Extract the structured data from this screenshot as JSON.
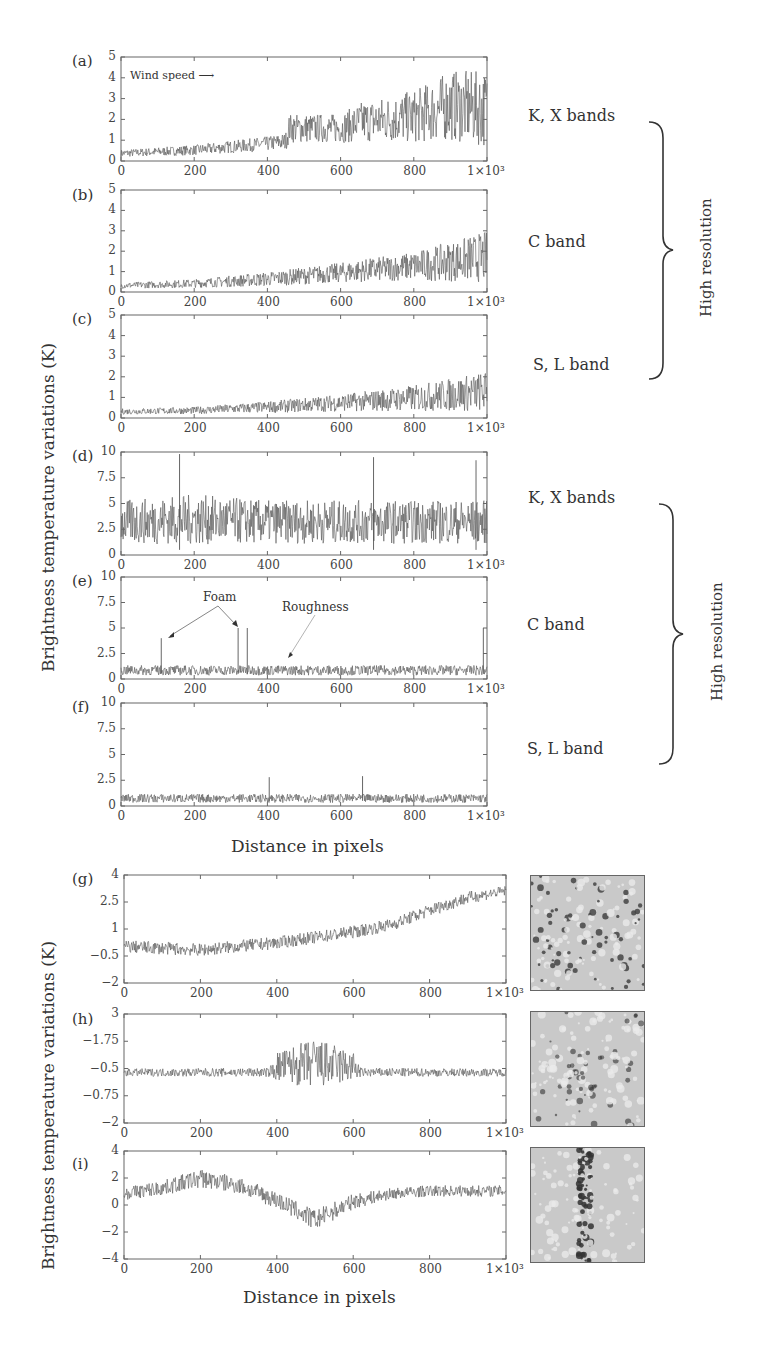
{
  "figure": {
    "y_axis_label_top": "Brightness temperature variations (K)",
    "y_axis_label_bottom": "Brightness temperature variations (K)",
    "x_axis_label_top": "Distance in pixels",
    "x_axis_label_bottom": "Distance in pixels",
    "bracket_label_1": "High resolution",
    "bracket_label_2": "High resolution",
    "bands": {
      "a": "K, X bands",
      "b": "C band",
      "c": "S, L band",
      "d": "K, X bands",
      "e": "C band",
      "f": "S, L band"
    },
    "annotations": {
      "wind_speed": "Wind speed",
      "foam": "Foam",
      "roughness": "Roughness"
    },
    "x_ticks": [
      "0",
      "200",
      "400",
      "600",
      "800",
      "1×10³"
    ],
    "line_color": "#555555"
  },
  "chart_data": [
    {
      "panel": "a",
      "label": "(a)",
      "type": "line",
      "band": "K, X bands",
      "xlabel": "Distance in pixels",
      "ylabel": "Brightness temperature variations (K)",
      "xlim": [
        0,
        1000
      ],
      "ylim": [
        0,
        5
      ],
      "yticks": [
        "0",
        "1",
        "2",
        "3",
        "4",
        "5"
      ],
      "x_ticks": [
        0,
        200,
        400,
        600,
        800,
        1000
      ],
      "annotation": "Wind speed →",
      "trend": {
        "x": [
          0,
          200,
          400,
          450,
          460,
          600,
          660,
          800,
          900,
          1000
        ],
        "mean": [
          0.35,
          0.5,
          0.8,
          0.9,
          1.5,
          1.5,
          1.8,
          2.0,
          2.5,
          2.3
        ],
        "spread": [
          0.25,
          0.35,
          0.5,
          0.6,
          1.0,
          1.0,
          1.4,
          1.8,
          2.4,
          2.6
        ]
      }
    },
    {
      "panel": "b",
      "label": "(b)",
      "type": "line",
      "band": "C band",
      "xlim": [
        0,
        1000
      ],
      "ylim": [
        0,
        5
      ],
      "yticks": [
        "0",
        "1",
        "2",
        "3",
        "4",
        "5"
      ],
      "trend": {
        "x": [
          0,
          200,
          400,
          600,
          800,
          1000
        ],
        "mean": [
          0.3,
          0.4,
          0.6,
          0.9,
          1.2,
          1.6
        ],
        "spread": [
          0.2,
          0.3,
          0.5,
          0.7,
          1.0,
          1.8
        ]
      }
    },
    {
      "panel": "c",
      "label": "(c)",
      "type": "line",
      "band": "S, L band",
      "xlim": [
        0,
        1000
      ],
      "ylim": [
        0,
        5
      ],
      "yticks": [
        "0",
        "1",
        "2",
        "3",
        "4",
        "5"
      ],
      "trend": {
        "x": [
          0,
          200,
          400,
          600,
          800,
          1000
        ],
        "mean": [
          0.3,
          0.35,
          0.5,
          0.7,
          0.9,
          1.2
        ],
        "spread": [
          0.2,
          0.25,
          0.4,
          0.6,
          0.9,
          1.4
        ]
      }
    },
    {
      "panel": "d",
      "label": "(d)",
      "type": "line",
      "band": "K, X bands",
      "xlim": [
        0,
        1000
      ],
      "ylim": [
        0,
        10
      ],
      "yticks": [
        "0",
        "2.5",
        "5",
        "7.5",
        "10"
      ],
      "trend": {
        "x": [
          0,
          200,
          400,
          600,
          800,
          1000
        ],
        "mean": [
          3,
          3.2,
          3,
          3,
          3,
          3
        ],
        "spread": [
          3,
          3.5,
          3,
          3,
          3,
          3
        ]
      },
      "peaks": [
        [
          160,
          9.8
        ],
        [
          690,
          9.5
        ],
        [
          970,
          9.2
        ]
      ]
    },
    {
      "panel": "e",
      "label": "(e)",
      "type": "line",
      "band": "C band",
      "xlim": [
        0,
        1000
      ],
      "ylim": [
        0,
        10
      ],
      "yticks": [
        "0",
        "2.5",
        "5",
        "7.5",
        "10"
      ],
      "annotations": [
        "Foam",
        "Roughness"
      ],
      "trend": {
        "x": [
          0,
          1000
        ],
        "mean": [
          0.8,
          0.8
        ],
        "spread": [
          0.7,
          0.7
        ]
      },
      "peaks": [
        [
          110,
          4.0
        ],
        [
          320,
          5.0
        ],
        [
          345,
          5.0
        ],
        [
          990,
          5.0
        ]
      ]
    },
    {
      "panel": "f",
      "label": "(f)",
      "type": "line",
      "band": "S, L band",
      "xlim": [
        0,
        1000
      ],
      "ylim": [
        0,
        10
      ],
      "yticks": [
        "0",
        "2.5",
        "5",
        "7.5",
        "10"
      ],
      "trend": {
        "x": [
          0,
          1000
        ],
        "mean": [
          0.7,
          0.7
        ],
        "spread": [
          0.6,
          0.6
        ]
      },
      "peaks": [
        [
          405,
          2.8
        ],
        [
          660,
          2.9
        ]
      ]
    },
    {
      "panel": "g",
      "label": "(g)",
      "type": "line",
      "xlim": [
        0,
        1000
      ],
      "ylim": [
        -2,
        4
      ],
      "yticks": [
        "-2",
        "-0.5",
        "1",
        "2.5",
        "4"
      ],
      "trend": {
        "x": [
          0,
          200,
          400,
          600,
          700,
          800,
          900,
          1000
        ],
        "mean": [
          0,
          -0.2,
          0.2,
          0.8,
          1.2,
          2.0,
          2.7,
          3.1
        ],
        "spread": [
          0.5,
          0.5,
          0.5,
          0.5,
          0.5,
          0.5,
          0.5,
          0.4
        ]
      }
    },
    {
      "panel": "h",
      "label": "(h)",
      "type": "line",
      "xlim": [
        0,
        1000
      ],
      "ylim": [
        -2,
        3
      ],
      "yticks": [
        "-2",
        "-0.75",
        "-0.5",
        "-1.75",
        "3"
      ],
      "trend": {
        "x": [
          0,
          380,
          400,
          500,
          600,
          620,
          1000
        ],
        "mean": [
          0.3,
          0.3,
          0.5,
          0.6,
          0.5,
          0.3,
          0.3
        ],
        "spread": [
          0.25,
          0.3,
          1.0,
          1.7,
          1.0,
          0.3,
          0.25
        ]
      }
    },
    {
      "panel": "i",
      "label": "(i)",
      "type": "line",
      "xlim": [
        0,
        1000
      ],
      "ylim": [
        -4,
        4
      ],
      "yticks": [
        "-4",
        "-2",
        "0",
        "2",
        "4"
      ],
      "trend": {
        "x": [
          0,
          100,
          200,
          300,
          400,
          500,
          600,
          700,
          800,
          1000
        ],
        "mean": [
          0.8,
          1.2,
          1.9,
          1.4,
          0.3,
          -1.2,
          0.2,
          0.8,
          1.0,
          1.0
        ],
        "spread": [
          0.7,
          0.8,
          1.0,
          0.9,
          0.9,
          1.1,
          0.8,
          0.6,
          0.6,
          0.6
        ]
      }
    }
  ],
  "thumbnails": [
    {
      "panel": "g",
      "description": "sea surface brightness image, scattered dark spots"
    },
    {
      "panel": "h",
      "description": "sea surface brightness image, central dark feature"
    },
    {
      "panel": "i",
      "description": "sea surface brightness image, vertical dark streak"
    }
  ]
}
